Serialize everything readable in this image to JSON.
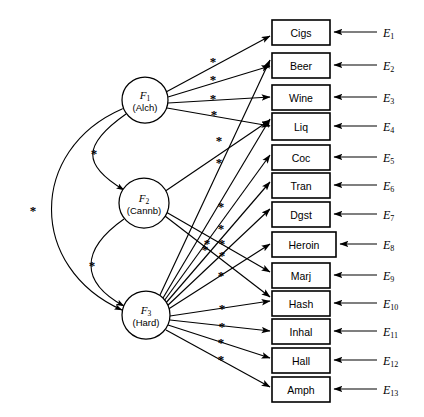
{
  "diagram": {
    "type": "structural-equation-model",
    "title": "",
    "free_parameter_symbol": "*",
    "factors": [
      {
        "id": "F1",
        "label": "F",
        "subscript": "1",
        "name": "(Alch)",
        "cx": 145,
        "cy": 100,
        "r": 23
      },
      {
        "id": "F2",
        "label": "F",
        "subscript": "2",
        "name": "(Cannb)",
        "cx": 144,
        "cy": 203,
        "r": 25
      },
      {
        "id": "F3",
        "label": "F",
        "subscript": "3",
        "name": "(Hard)",
        "cx": 146,
        "cy": 315,
        "r": 24
      }
    ],
    "indicators": [
      {
        "id": "I1",
        "label": "Cigs",
        "x": 272,
        "y": 20,
        "w": 58,
        "h": 25
      },
      {
        "id": "I2",
        "label": "Beer",
        "x": 272,
        "y": 53,
        "w": 58,
        "h": 25
      },
      {
        "id": "I3",
        "label": "Wine",
        "x": 272,
        "y": 85,
        "w": 58,
        "h": 25
      },
      {
        "id": "I4",
        "label": "Liq",
        "x": 272,
        "y": 113,
        "w": 58,
        "h": 27
      },
      {
        "id": "I5",
        "label": "Coc",
        "x": 272,
        "y": 145,
        "w": 58,
        "h": 25
      },
      {
        "id": "I6",
        "label": "Tran",
        "x": 272,
        "y": 173,
        "w": 58,
        "h": 25
      },
      {
        "id": "I7",
        "label": "Dgst",
        "x": 272,
        "y": 202,
        "w": 58,
        "h": 25
      },
      {
        "id": "I8",
        "label": "Heroin",
        "x": 272,
        "y": 232,
        "w": 64,
        "h": 25
      },
      {
        "id": "I9",
        "label": "Marj",
        "x": 272,
        "y": 263,
        "w": 58,
        "h": 25
      },
      {
        "id": "I10",
        "label": "Hash",
        "x": 272,
        "y": 291,
        "w": 58,
        "h": 25
      },
      {
        "id": "I11",
        "label": "Inhal",
        "x": 272,
        "y": 319,
        "w": 58,
        "h": 25
      },
      {
        "id": "I12",
        "label": "Hall",
        "x": 272,
        "y": 348,
        "w": 58,
        "h": 25
      },
      {
        "id": "I13",
        "label": "Amph",
        "x": 272,
        "y": 377,
        "w": 58,
        "h": 25
      }
    ],
    "errors": [
      {
        "id": "E1",
        "label": "E",
        "subscript": "1",
        "x": 383,
        "y": 32
      },
      {
        "id": "E2",
        "label": "E",
        "subscript": "2",
        "x": 383,
        "y": 65
      },
      {
        "id": "E3",
        "label": "E",
        "subscript": "3",
        "x": 383,
        "y": 97
      },
      {
        "id": "E4",
        "label": "E",
        "subscript": "4",
        "x": 383,
        "y": 126
      },
      {
        "id": "E5",
        "label": "E",
        "subscript": "5",
        "x": 383,
        "y": 157
      },
      {
        "id": "E6",
        "label": "E",
        "subscript": "6",
        "x": 383,
        "y": 185
      },
      {
        "id": "E7",
        "label": "E",
        "subscript": "7",
        "x": 383,
        "y": 214
      },
      {
        "id": "E8",
        "label": "E",
        "subscript": "8",
        "x": 383,
        "y": 244
      },
      {
        "id": "E9",
        "label": "E",
        "subscript": "9",
        "x": 383,
        "y": 275
      },
      {
        "id": "E10",
        "label": "E",
        "subscript": "10",
        "x": 383,
        "y": 303
      },
      {
        "id": "E11",
        "label": "E",
        "subscript": "11",
        "x": 383,
        "y": 331
      },
      {
        "id": "E12",
        "label": "E",
        "subscript": "12",
        "x": 383,
        "y": 360
      },
      {
        "id": "E13",
        "label": "E",
        "subscript": "13",
        "x": 383,
        "y": 389
      }
    ],
    "loadings": [
      {
        "from": "F1",
        "to": "I1",
        "x1": 166,
        "y1": 92,
        "x2": 270,
        "y2": 36,
        "star": {
          "x": 213,
          "y": 61
        }
      },
      {
        "from": "F1",
        "to": "I2",
        "x1": 168,
        "y1": 97,
        "x2": 270,
        "y2": 66,
        "star": {
          "x": 213,
          "y": 79
        }
      },
      {
        "from": "F1",
        "to": "I3",
        "x1": 168,
        "y1": 103,
        "x2": 270,
        "y2": 97,
        "star": {
          "x": 213,
          "y": 98
        }
      },
      {
        "from": "F1",
        "to": "I4",
        "x1": 167,
        "y1": 108,
        "x2": 270,
        "y2": 126,
        "star": {
          "x": 214,
          "y": 114
        }
      },
      {
        "from": "F2",
        "to": "I4",
        "x1": 164,
        "y1": 192,
        "x2": 270,
        "y2": 120,
        "star": {
          "x": 219,
          "y": 140
        }
      },
      {
        "from": "F2",
        "to": "I9",
        "x1": 166,
        "y1": 212,
        "x2": 270,
        "y2": 272,
        "star": {
          "x": 207,
          "y": 243
        }
      },
      {
        "from": "F2",
        "to": "I10",
        "x1": 165,
        "y1": 216,
        "x2": 270,
        "y2": 297,
        "star": {
          "x": 205,
          "y": 249
        }
      },
      {
        "from": "F3",
        "to": "I2",
        "x1": 160,
        "y1": 295,
        "x2": 270,
        "y2": 60,
        "star": {
          "x": 219,
          "y": 162
        }
      },
      {
        "from": "F3",
        "to": "I4",
        "x1": 163,
        "y1": 298,
        "x2": 270,
        "y2": 119,
        "star": {
          "x": 221,
          "y": 206
        }
      },
      {
        "from": "F3",
        "to": "I5",
        "x1": 164,
        "y1": 301,
        "x2": 270,
        "y2": 155,
        "star": {
          "x": 221,
          "y": 228
        }
      },
      {
        "from": "F3",
        "to": "I6",
        "x1": 165,
        "y1": 304,
        "x2": 270,
        "y2": 182,
        "star": {
          "x": 222,
          "y": 243
        }
      },
      {
        "from": "F3",
        "to": "I7",
        "x1": 166,
        "y1": 307,
        "x2": 270,
        "y2": 209,
        "star": {
          "x": 222,
          "y": 255
        }
      },
      {
        "from": "F3",
        "to": "I8",
        "x1": 167,
        "y1": 310,
        "x2": 270,
        "y2": 244,
        "star": {
          "x": 221,
          "y": 275
        }
      },
      {
        "from": "F3",
        "to": "I10",
        "x1": 170,
        "y1": 316,
        "x2": 270,
        "y2": 301,
        "star": {
          "x": 222,
          "y": 308
        }
      },
      {
        "from": "F3",
        "to": "I11",
        "x1": 170,
        "y1": 320,
        "x2": 270,
        "y2": 331,
        "star": {
          "x": 222,
          "y": 326
        }
      },
      {
        "from": "F3",
        "to": "I12",
        "x1": 168,
        "y1": 325,
        "x2": 270,
        "y2": 358,
        "star": {
          "x": 221,
          "y": 342
        }
      },
      {
        "from": "F3",
        "to": "I13",
        "x1": 166,
        "y1": 330,
        "x2": 270,
        "y2": 387,
        "star": {
          "x": 221,
          "y": 359
        }
      }
    ],
    "error_paths": [
      {
        "from": "E1",
        "to": "I1",
        "y": 32,
        "x1": 377,
        "x2": 334
      },
      {
        "from": "E2",
        "to": "I2",
        "y": 65,
        "x1": 377,
        "x2": 334
      },
      {
        "from": "E3",
        "to": "I3",
        "y": 97,
        "x1": 377,
        "x2": 334
      },
      {
        "from": "E4",
        "to": "I4",
        "y": 126,
        "x1": 377,
        "x2": 334
      },
      {
        "from": "E5",
        "to": "I5",
        "y": 157,
        "x1": 377,
        "x2": 334
      },
      {
        "from": "E6",
        "to": "I6",
        "y": 185,
        "x1": 377,
        "x2": 334
      },
      {
        "from": "E7",
        "to": "I7",
        "y": 214,
        "x1": 377,
        "x2": 334
      },
      {
        "from": "E8",
        "to": "I8",
        "y": 244,
        "x1": 377,
        "x2": 340
      },
      {
        "from": "E9",
        "to": "I9",
        "y": 275,
        "x1": 377,
        "x2": 334
      },
      {
        "from": "E10",
        "to": "I10",
        "y": 303,
        "x1": 377,
        "x2": 334
      },
      {
        "from": "E11",
        "to": "I11",
        "y": 331,
        "x1": 377,
        "x2": 334
      },
      {
        "from": "E12",
        "to": "I12",
        "y": 360,
        "x1": 377,
        "x2": 334
      },
      {
        "from": "E13",
        "to": "I13",
        "y": 389,
        "x1": 377,
        "x2": 334
      }
    ],
    "covariances": [
      {
        "id": "cov-F1-F2",
        "between": [
          "F1",
          "F2"
        ],
        "path": "M 126 114 C 82 145, 82 165, 124 190",
        "star": {
          "x": 94,
          "y": 153
        }
      },
      {
        "id": "cov-F2-F3",
        "between": [
          "F2",
          "F3"
        ],
        "path": "M 124 219 C 80 250, 80 282, 124 306",
        "star": {
          "x": 92,
          "y": 265
        }
      },
      {
        "id": "cov-F1-F3",
        "between": [
          "F1",
          "F3"
        ],
        "path": "M 122 109 C 28 150, 28 268, 122 310",
        "star": {
          "x": 33,
          "y": 210
        }
      }
    ]
  }
}
